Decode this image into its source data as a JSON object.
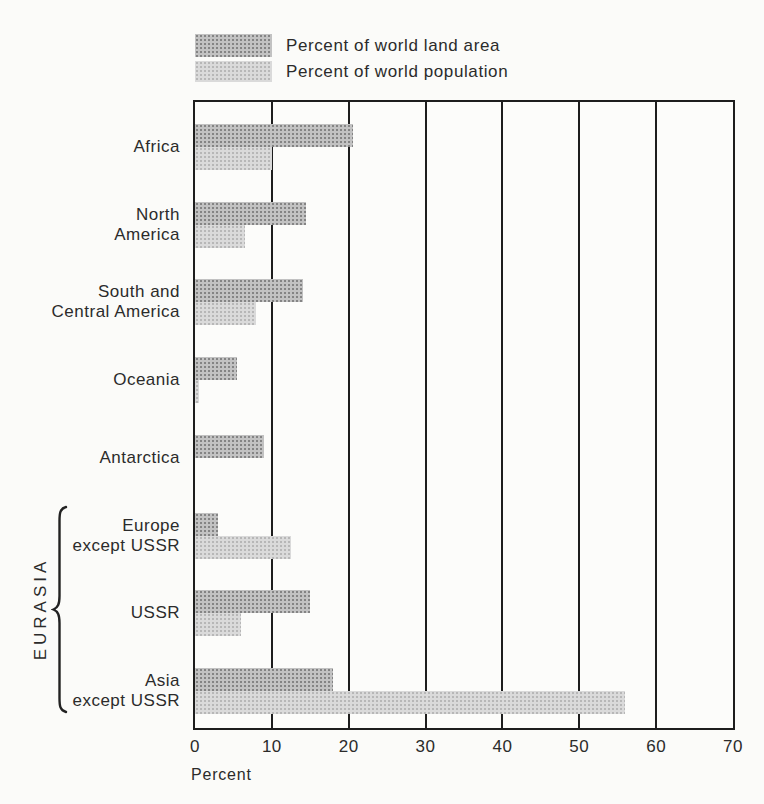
{
  "chart_data": {
    "type": "bar",
    "orientation": "horizontal",
    "title": "",
    "xlabel": "Percent",
    "xlim": [
      0,
      70
    ],
    "xticks": [
      0,
      10,
      20,
      30,
      40,
      50,
      60,
      70
    ],
    "grid": "vertical gridlines every 10 percent",
    "legend_position": "top-left above plot",
    "categories": [
      "Africa",
      "North America",
      "South and Central America",
      "Oceania",
      "Antarctica",
      "Europe except USSR",
      "USSR",
      "Asia except USSR"
    ],
    "category_label_lines": [
      [
        "Africa"
      ],
      [
        "North",
        "America"
      ],
      [
        "South and",
        "Central America"
      ],
      [
        "Oceania"
      ],
      [
        "Antarctica"
      ],
      [
        "Europe",
        "except USSR"
      ],
      [
        "USSR"
      ],
      [
        "Asia",
        "except USSR"
      ]
    ],
    "series": [
      {
        "name": "Percent of world land area",
        "pattern": "halftone-dark",
        "color": "#a2a2a2",
        "values": [
          20.5,
          14.5,
          14,
          5.5,
          9,
          3,
          15,
          18
        ]
      },
      {
        "name": "Percent of world population",
        "pattern": "halftone-light",
        "color": "#cccccc",
        "values": [
          10,
          6.5,
          8,
          0.5,
          0,
          12.5,
          6,
          56
        ]
      }
    ],
    "group_label": {
      "text": "EURASIA",
      "categories": [
        "Europe except USSR",
        "USSR",
        "Asia except USSR"
      ]
    }
  },
  "colors": {
    "background": "#fbfbf9",
    "axis": "#1d1d1d",
    "text": "#2b2b2b",
    "bar_dark_dot": "#848484",
    "bar_dark_base": "#c2c2c2",
    "bar_light_dot": "#b7b7b7",
    "bar_light_base": "#dadada"
  }
}
